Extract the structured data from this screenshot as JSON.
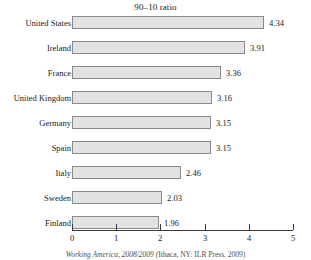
{
  "chart_data": {
    "type": "bar",
    "orientation": "horizontal",
    "title": "90–10 ratio",
    "xlabel": "",
    "ylabel": "",
    "xlim": [
      0,
      5
    ],
    "xticks": [
      "0",
      "1",
      "2",
      "3",
      "4",
      "5"
    ],
    "grid": false,
    "legend": null,
    "categories": [
      "United States",
      "Ireland",
      "France",
      "United Kingdom",
      "Germany",
      "Spain",
      "Italy",
      "Sweden",
      "Finland"
    ],
    "values": [
      4.34,
      3.91,
      3.36,
      3.16,
      3.15,
      3.15,
      2.46,
      2.03,
      1.96
    ],
    "value_labels": [
      "4.34",
      "3.91",
      "3.36",
      "3.16",
      "3.15",
      "3.15",
      "2.46",
      "2.03",
      "1.96"
    ],
    "bar_fill_color": "#e2e2e2",
    "bar_border_color": "#8a8a8a",
    "axis_color": "#3a3a3a"
  },
  "caption": {
    "source_italic": "Working America, 2008/2009",
    "source_rest": " (Ithaca, NY: ILR Press, 2009)"
  }
}
